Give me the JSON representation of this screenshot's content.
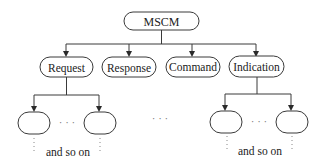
{
  "diagram": {
    "root": {
      "label": "MSCM"
    },
    "children": [
      {
        "label": "Request",
        "expanded": true
      },
      {
        "label": "Response",
        "expanded": false
      },
      {
        "label": "Command",
        "expanded": false
      },
      {
        "label": "Indication",
        "expanded": true
      }
    ],
    "ellipsis": "· · ·",
    "continuation_note": "and so on"
  }
}
